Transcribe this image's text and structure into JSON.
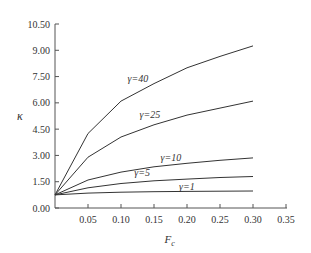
{
  "chart_data": {
    "type": "line",
    "title": "",
    "xlabel": "F_c",
    "ylabel": "κ",
    "xlim": [
      0,
      0.35
    ],
    "ylim": [
      0,
      10.5
    ],
    "xticks": [
      "0.05",
      "0.10",
      "0.15",
      "0.20",
      "0.25",
      "0.30",
      "0.35"
    ],
    "yticks": [
      "0.00",
      "1.50",
      "3.00",
      "4.50",
      "6.00",
      "7.50",
      "9.00",
      "10.50"
    ],
    "grid": false,
    "x": [
      0.0,
      0.05,
      0.1,
      0.15,
      0.2,
      0.25,
      0.3
    ],
    "series": [
      {
        "name": "γ=40",
        "values": [
          0.75,
          4.25,
          6.1,
          7.1,
          8.0,
          8.65,
          9.25
        ]
      },
      {
        "name": "γ=25",
        "values": [
          0.75,
          2.9,
          4.05,
          4.75,
          5.3,
          5.7,
          6.1
        ]
      },
      {
        "name": "γ=10",
        "values": [
          0.75,
          1.6,
          2.05,
          2.35,
          2.55,
          2.72,
          2.86
        ]
      },
      {
        "name": "γ=5",
        "values": [
          0.75,
          1.15,
          1.4,
          1.55,
          1.65,
          1.74,
          1.8
        ]
      },
      {
        "name": "γ=1",
        "values": [
          0.75,
          0.85,
          0.9,
          0.93,
          0.95,
          0.96,
          0.97
        ]
      }
    ],
    "annotations": [
      {
        "text": "γ=40",
        "x": 0.11,
        "y": 7.2
      },
      {
        "text": "γ=25",
        "x": 0.128,
        "y": 5.15
      },
      {
        "text": "γ=10",
        "x": 0.16,
        "y": 2.7
      },
      {
        "text": "γ=5",
        "x": 0.12,
        "y": 1.85
      },
      {
        "text": "γ=1",
        "x": 0.188,
        "y": 1.05
      }
    ]
  }
}
